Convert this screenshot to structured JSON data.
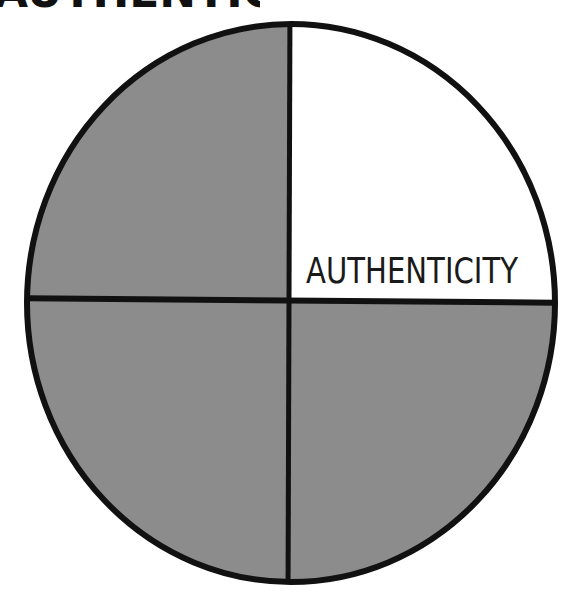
{
  "title": "AUTHENTICITY",
  "diagram": {
    "type": "quadrant-circle",
    "colors": {
      "filled": "#8c8c8c",
      "highlight": "#ffffff",
      "stroke": "#111111"
    },
    "quadrants": [
      {
        "position": "top-left",
        "label": "",
        "highlighted": false
      },
      {
        "position": "top-right",
        "label": "AUTHENTICITY",
        "highlighted": true
      },
      {
        "position": "bottom-left",
        "label": "",
        "highlighted": false
      },
      {
        "position": "bottom-right",
        "label": "",
        "highlighted": false
      }
    ]
  }
}
